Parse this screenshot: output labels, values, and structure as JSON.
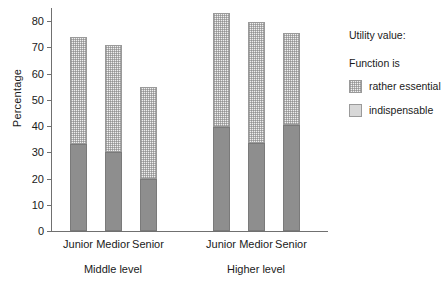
{
  "chart_data": {
    "type": "bar",
    "subtype": "stacked",
    "title": "",
    "xlabel": "",
    "ylabel": "Percentage",
    "ylim": [
      0,
      85
    ],
    "yticks": [
      0,
      10,
      20,
      30,
      40,
      50,
      60,
      70,
      80
    ],
    "ytick_labels": [
      "0",
      "10",
      "20",
      "30",
      "40",
      "50",
      "60",
      "70",
      "80"
    ],
    "grid": false,
    "categories": [
      "Junior",
      "Medior",
      "Senior",
      "Junior",
      "Medior",
      "Senior"
    ],
    "groups": [
      {
        "label": "Middle level",
        "categories": [
          "Junior",
          "Medior",
          "Senior"
        ]
      },
      {
        "label": "Higher level",
        "categories": [
          "Junior",
          "Medior",
          "Senior"
        ]
      }
    ],
    "series": [
      {
        "name": "indispensable",
        "values": [
          33,
          30,
          20,
          39.5,
          33.5,
          40.5
        ]
      },
      {
        "name": "rather essential",
        "values": [
          41,
          41,
          35,
          43.5,
          46,
          35
        ]
      }
    ],
    "totals": [
      74,
      71,
      55,
      83,
      79.5,
      75.5
    ],
    "legend_position": "right",
    "colors": {
      "indispensable": "#8e8e8e",
      "rather_essential": "#f0f0f0",
      "axis": "#707070",
      "text": "#1a1a1a",
      "background": "#ffffff"
    }
  },
  "axes": {
    "y_title": "Percentage"
  },
  "legend": {
    "title": "Utility value:",
    "subtitle": "Function is",
    "entries": [
      {
        "label": "rather essential",
        "key": "essential"
      },
      {
        "label": "indispensable",
        "key": "indispensable"
      }
    ]
  }
}
